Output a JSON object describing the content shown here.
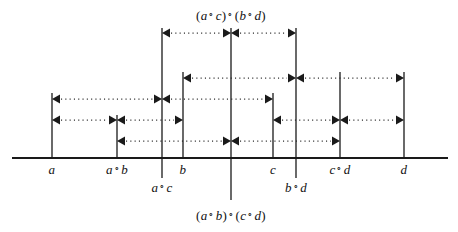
{
  "figure": {
    "type": "number-line-interval-diagram",
    "baseline_y": 158,
    "width": 458,
    "height": 232,
    "stroke_color": "#1a1a1a",
    "dot_color": "#2b2b2b"
  },
  "points": [
    {
      "id": "a",
      "label": "a",
      "x": 52,
      "label_x": 52,
      "label_y": 162,
      "line_top": 93,
      "line_bottom": 158
    },
    {
      "id": "ab",
      "label": "a ∘ b",
      "x": 117,
      "label_x": 117,
      "label_y": 162,
      "line_top": 115,
      "line_bottom": 158
    },
    {
      "id": "ac",
      "label": "a ∘ c",
      "x": 162,
      "label_x": 162,
      "label_y": 180,
      "line_top": 28,
      "line_bottom": 178
    },
    {
      "id": "b",
      "label": "b",
      "x": 183,
      "label_x": 183,
      "label_y": 162,
      "line_top": 72,
      "line_bottom": 158
    },
    {
      "id": "center",
      "label": "(a ∘ b) ∘ (c ∘ d)",
      "x": 231,
      "label_x": 231,
      "label_y": 208,
      "line_top": 28,
      "line_bottom": 200
    },
    {
      "id": "c",
      "label": "c",
      "x": 273,
      "label_x": 273,
      "label_y": 162,
      "line_top": 93,
      "line_bottom": 158
    },
    {
      "id": "bd",
      "label": "b ∘ d",
      "x": 296,
      "label_x": 296,
      "label_y": 180,
      "line_top": 28,
      "line_bottom": 178
    },
    {
      "id": "cd",
      "label": "c ∘ d",
      "x": 340,
      "label_x": 340,
      "label_y": 162,
      "line_top": 72,
      "line_bottom": 158
    },
    {
      "id": "d",
      "label": "d",
      "x": 404,
      "label_x": 404,
      "label_y": 162,
      "line_top": 72,
      "line_bottom": 158
    }
  ],
  "top_label": {
    "text": "(a ∘ c) ∘ (b ∘ d)",
    "x": 231,
    "y": 8
  },
  "bottom_label": {
    "text": "(a ∘ b) ∘ (c ∘ d)",
    "x": 231,
    "y": 208
  },
  "axis": {
    "x1": 12,
    "x2": 448,
    "y": 158
  },
  "arrow_rows": [
    {
      "y": 33,
      "segments": [
        {
          "from": 162,
          "to": 231
        },
        {
          "from": 231,
          "to": 296
        }
      ]
    },
    {
      "y": 78,
      "segments": [
        {
          "from": 183,
          "to": 296
        },
        {
          "from": 296,
          "to": 404
        }
      ]
    },
    {
      "y": 99,
      "segments": [
        {
          "from": 52,
          "to": 162
        },
        {
          "from": 162,
          "to": 273
        }
      ]
    },
    {
      "y": 120,
      "segments": [
        {
          "from": 52,
          "to": 117
        },
        {
          "from": 117,
          "to": 183
        },
        {
          "from": 273,
          "to": 340
        },
        {
          "from": 340,
          "to": 404
        }
      ]
    },
    {
      "y": 141,
      "segments": [
        {
          "from": 117,
          "to": 231
        },
        {
          "from": 231,
          "to": 340
        }
      ]
    }
  ],
  "math_labels": {
    "a": "a",
    "ab": "a ∘ b",
    "ac": "a ∘ c",
    "b": "b",
    "c": "c",
    "bd": "b ∘ d",
    "cd": "c ∘ d",
    "d": "d",
    "top": "(a ∘ c) ∘ (b ∘ d)",
    "bottom": "(a ∘ b) ∘ (c ∘ d)"
  }
}
